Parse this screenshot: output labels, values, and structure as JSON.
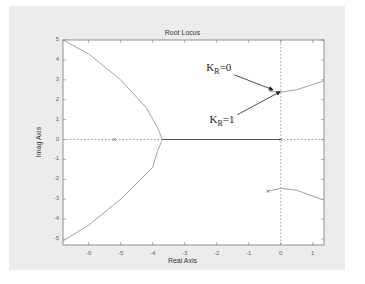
{
  "chart_data": {
    "type": "line",
    "title": "Root Locus",
    "xlabel": "Real Axis",
    "ylabel": "Imag Axis",
    "xlim": [
      -6.8,
      1.35
    ],
    "ylim": [
      -5.3,
      5
    ],
    "xticks": [
      -6,
      -5,
      -4,
      -3,
      -2,
      -1,
      0,
      1
    ],
    "yticks": [
      5,
      4,
      3,
      2,
      1,
      0,
      -1,
      -2,
      -3,
      -4,
      -5
    ],
    "grid": false,
    "series": [
      {
        "name": "upper-left branch",
        "x": [
          -6.8,
          -6.0,
          -5.0,
          -4.2,
          -3.85,
          -3.7
        ],
        "y": [
          5.0,
          4.3,
          3.0,
          1.6,
          0.6,
          0.0
        ]
      },
      {
        "name": "lower-left branch",
        "x": [
          -3.7,
          -3.85,
          -4.0,
          -5.0,
          -6.0,
          -6.8
        ],
        "y": [
          0.0,
          -0.6,
          -1.4,
          -3.0,
          -4.3,
          -5.1
        ]
      },
      {
        "name": "real-axis segment",
        "x": [
          -3.7,
          0.0
        ],
        "y": [
          0.0,
          0.0
        ]
      },
      {
        "name": "upper-right branch",
        "x": [
          -0.3,
          0.0,
          0.5,
          1.35
        ],
        "y": [
          2.45,
          2.38,
          2.5,
          2.95
        ]
      },
      {
        "name": "lower-right branch",
        "x": [
          -0.4,
          0.0,
          0.5,
          1.35
        ],
        "y": [
          -2.6,
          -2.45,
          -2.55,
          -3.05
        ]
      }
    ],
    "poles": [
      {
        "x": -5.2,
        "y": 0
      },
      {
        "x": 0.0,
        "y": 0
      },
      {
        "x": -0.3,
        "y": 2.45
      },
      {
        "x": -0.4,
        "y": -2.6
      }
    ],
    "annotations": [
      {
        "text_main": "K",
        "text_sub": "R",
        "text_rest": "=0",
        "x": -1.45,
        "y": 3.55,
        "arrow_to": [
          -0.25,
          2.5
        ]
      },
      {
        "text_main": "K",
        "text_sub": "R",
        "text_rest": "=1",
        "x": -1.35,
        "y": 0.95,
        "arrow_to": [
          -0.02,
          2.4
        ]
      }
    ],
    "dotted_lines": [
      {
        "orientation": "vertical",
        "x": 0
      },
      {
        "orientation": "horizontal",
        "y": 0
      }
    ]
  }
}
